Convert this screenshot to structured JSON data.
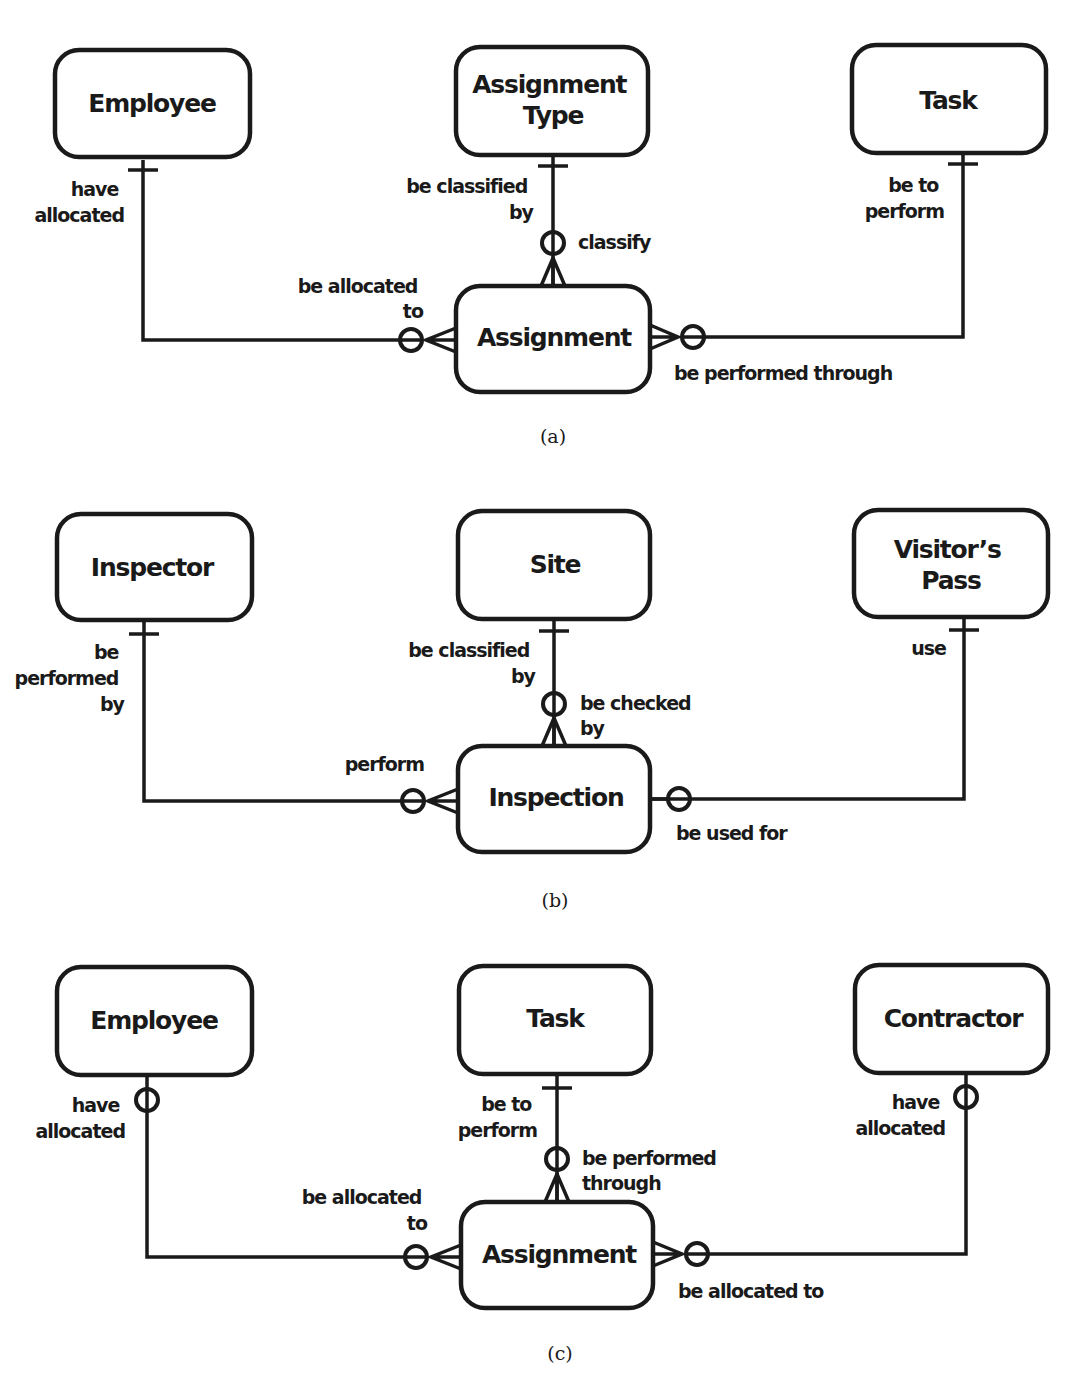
{
  "figure": {
    "diagrams": [
      {
        "id": "a",
        "caption": "(a)",
        "entities": {
          "left": "Employee",
          "top_line1": "Assignment",
          "top_line2": "Type",
          "right": "Task",
          "center": "Assignment"
        },
        "labels": {
          "left_vert": [
            "have",
            "allocated"
          ],
          "left_horiz": [
            "be allocated",
            "to"
          ],
          "top_vert": [
            "be classified",
            "by"
          ],
          "top_near_center": [
            "classify"
          ],
          "right_vert": [
            "be to",
            "perform"
          ],
          "right_horiz": [
            "be performed through"
          ]
        }
      },
      {
        "id": "b",
        "caption": "(b)",
        "entities": {
          "left": "Inspector",
          "top": "Site",
          "right_line1": "Visitor’s",
          "right_line2": "Pass",
          "center": "Inspection"
        },
        "labels": {
          "left_vert": [
            "be",
            "performed",
            "by"
          ],
          "left_horiz": [
            "perform"
          ],
          "top_vert": [
            "be classified",
            "by"
          ],
          "top_near_center": [
            "be checked",
            "by"
          ],
          "right_vert": [
            "use"
          ],
          "right_horiz": [
            "be used for"
          ]
        }
      },
      {
        "id": "c",
        "caption": "(c)",
        "entities": {
          "left": "Employee",
          "top": "Task",
          "right": "Contractor",
          "center": "Assignment"
        },
        "labels": {
          "left_vert": [
            "have",
            "allocated"
          ],
          "left_horiz": [
            "be allocated",
            "to"
          ],
          "top_vert": [
            "be to",
            "perform"
          ],
          "top_near_center": [
            "be performed",
            "through"
          ],
          "right_vert": [
            "have",
            "allocated"
          ],
          "right_horiz": [
            "be allocated to"
          ]
        }
      }
    ]
  }
}
